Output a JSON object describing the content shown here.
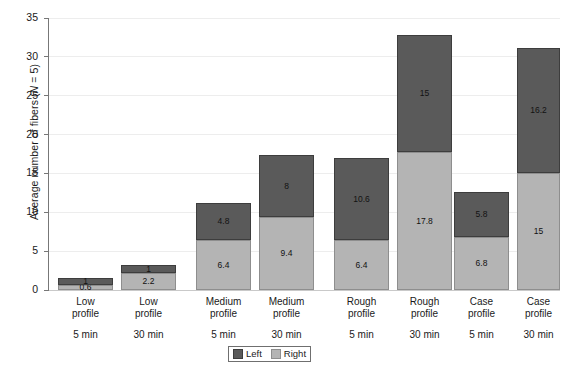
{
  "chart_data": {
    "type": "bar",
    "stacked": true,
    "title": "",
    "xlabel": "",
    "ylabel": "Average  number of fibers (N = 5)",
    "ylim": [
      0,
      35
    ],
    "yticks": [
      0,
      5,
      10,
      15,
      20,
      25,
      30,
      35
    ],
    "grid": true,
    "legend_position": "bottom-center",
    "categories": [
      "Low profile 5 min",
      "Low profile 30 min",
      "Medium profile 5 min",
      "Medium profile 30 min",
      "Rough profile 5 min",
      "Rough profile 30 min",
      "Case profile 5 min",
      "Case profile 30 min"
    ],
    "category_labels": [
      {
        "profile_line1": "Low",
        "profile_line2": "profile",
        "time": "5 min"
      },
      {
        "profile_line1": "Low",
        "profile_line2": "profile",
        "time": "30 min"
      },
      {
        "profile_line1": "Medium",
        "profile_line2": "profile",
        "time": "5 min"
      },
      {
        "profile_line1": "Medium",
        "profile_line2": "profile",
        "time": "30 min"
      },
      {
        "profile_line1": "Rough",
        "profile_line2": "profile",
        "time": "5 min"
      },
      {
        "profile_line1": "Rough",
        "profile_line2": "profile",
        "time": "30 min"
      },
      {
        "profile_line1": "Case",
        "profile_line2": "profile",
        "time": "5 min"
      },
      {
        "profile_line1": "Case",
        "profile_line2": "profile",
        "time": "30 min"
      }
    ],
    "series": [
      {
        "name": "Right",
        "color": "#b4b4b4",
        "values": [
          0.6,
          2.2,
          6.4,
          9.4,
          6.4,
          17.8,
          6.8,
          15
        ],
        "labels": [
          "0.6",
          "2.2",
          "6.4",
          "9.4",
          "6.4",
          "17.8",
          "6.8",
          "15"
        ]
      },
      {
        "name": "Left",
        "color": "#5a5a5a",
        "values": [
          1,
          1,
          4.8,
          8,
          10.6,
          15,
          5.8,
          16.2
        ],
        "labels": [
          "1",
          "1",
          "4.8",
          "8",
          "10.6",
          "15",
          "5.8",
          "16.2"
        ]
      }
    ],
    "totals": [
      1.6,
      3.2,
      11.2,
      17.4,
      17.0,
      32.8,
      12.6,
      31.2
    ]
  },
  "legend": {
    "items": [
      {
        "label": "Left",
        "color": "#5a5a5a"
      },
      {
        "label": "Right",
        "color": "#b4b4b4"
      }
    ]
  },
  "axis": {
    "y_title_prefix": "Average  number of fibers (",
    "y_title_italic": "N",
    "y_title_suffix": " = 5)",
    "y_tick_labels": [
      "0",
      "5",
      "10",
      "15",
      "20",
      "25",
      "30",
      "35"
    ]
  }
}
